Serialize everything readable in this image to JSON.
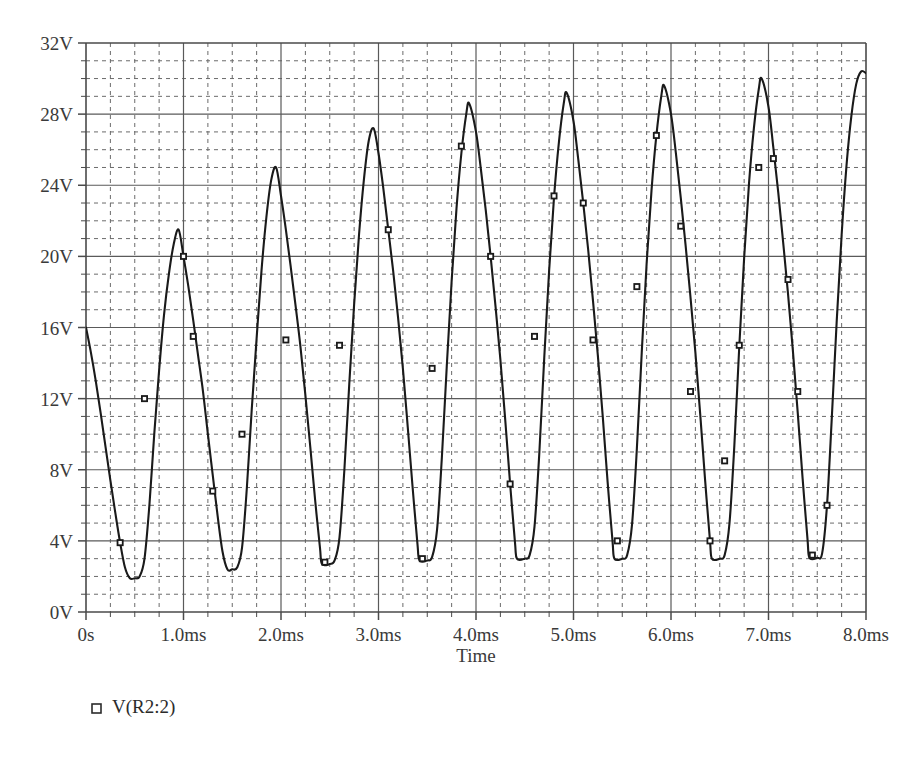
{
  "chart_data": {
    "type": "line",
    "title": "",
    "subtitle": "",
    "xlabel": "Time",
    "ylabel": "",
    "xlim": [
      0,
      8
    ],
    "ylim": [
      0,
      32
    ],
    "x_unit": "ms",
    "y_unit": "V",
    "grid": true,
    "grid_major_x_step": 1,
    "grid_major_y_step": 4,
    "grid_minor_x_step": 0.25,
    "grid_minor_y_step": 1,
    "legend_position": "below-left",
    "xticks": [
      0,
      1,
      2,
      3,
      4,
      5,
      6,
      7,
      8
    ],
    "xticklabels": [
      "0s",
      "1.0ms",
      "2.0ms",
      "3.0ms",
      "4.0ms",
      "5.0ms",
      "6.0ms",
      "7.0ms",
      "8.0ms"
    ],
    "yticks": [
      0,
      4,
      8,
      12,
      16,
      20,
      24,
      28,
      32
    ],
    "yticklabels": [
      "0V",
      "4V",
      "8V",
      "12V",
      "16V",
      "20V",
      "24V",
      "28V",
      "32V"
    ],
    "series": [
      {
        "name": "V(R2:2)",
        "color": "#1a1a1a",
        "marker": "square",
        "peaks": [
          {
            "t": 0.95,
            "v": 21.5
          },
          {
            "t": 1.95,
            "v": 25.0
          },
          {
            "t": 2.95,
            "v": 27.2
          },
          {
            "t": 3.93,
            "v": 28.6
          },
          {
            "t": 4.93,
            "v": 29.2
          },
          {
            "t": 5.93,
            "v": 29.6
          },
          {
            "t": 6.93,
            "v": 30.0
          },
          {
            "t": 7.95,
            "v": 30.4
          }
        ],
        "troughs": [
          {
            "t": 0.45,
            "v": 1.9
          },
          {
            "t": 1.45,
            "v": 2.4
          },
          {
            "t": 2.42,
            "v": 2.7
          },
          {
            "t": 3.42,
            "v": 2.9
          },
          {
            "t": 4.42,
            "v": 3.0
          },
          {
            "t": 5.42,
            "v": 3.0
          },
          {
            "t": 6.42,
            "v": 3.0
          },
          {
            "t": 7.42,
            "v": 3.05
          }
        ],
        "points": [
          {
            "t": 0.0,
            "v": 16.0
          },
          {
            "t": 0.05,
            "v": 14.6
          },
          {
            "t": 0.1,
            "v": 13.0
          },
          {
            "t": 0.15,
            "v": 11.2
          },
          {
            "t": 0.2,
            "v": 9.3
          },
          {
            "t": 0.25,
            "v": 7.4
          },
          {
            "t": 0.3,
            "v": 5.6
          },
          {
            "t": 0.35,
            "v": 3.9
          },
          {
            "t": 0.4,
            "v": 2.5
          },
          {
            "t": 0.45,
            "v": 1.9
          },
          {
            "t": 0.5,
            "v": 1.9
          },
          {
            "t": 0.55,
            "v": 2.0
          },
          {
            "t": 0.6,
            "v": 3.0
          },
          {
            "t": 0.65,
            "v": 6.0
          },
          {
            "t": 0.7,
            "v": 10.0
          },
          {
            "t": 0.75,
            "v": 13.6
          },
          {
            "t": 0.8,
            "v": 16.7
          },
          {
            "t": 0.85,
            "v": 19.0
          },
          {
            "t": 0.9,
            "v": 20.7
          },
          {
            "t": 0.95,
            "v": 21.5
          },
          {
            "t": 1.0,
            "v": 20.0
          },
          {
            "t": 1.05,
            "v": 18.3
          },
          {
            "t": 1.1,
            "v": 16.4
          },
          {
            "t": 1.15,
            "v": 14.4
          },
          {
            "t": 1.2,
            "v": 12.4
          },
          {
            "t": 1.25,
            "v": 10.0
          },
          {
            "t": 1.3,
            "v": 7.7
          },
          {
            "t": 1.35,
            "v": 5.4
          },
          {
            "t": 1.4,
            "v": 3.4
          },
          {
            "t": 1.45,
            "v": 2.4
          },
          {
            "t": 1.5,
            "v": 2.4
          },
          {
            "t": 1.55,
            "v": 2.5
          },
          {
            "t": 1.6,
            "v": 3.6
          },
          {
            "t": 1.65,
            "v": 7.0
          },
          {
            "t": 1.7,
            "v": 11.4
          },
          {
            "t": 1.75,
            "v": 15.4
          },
          {
            "t": 1.8,
            "v": 19.2
          },
          {
            "t": 1.85,
            "v": 22.2
          },
          {
            "t": 1.9,
            "v": 24.3
          },
          {
            "t": 1.95,
            "v": 25.0
          },
          {
            "t": 2.0,
            "v": 23.4
          },
          {
            "t": 2.05,
            "v": 21.5
          },
          {
            "t": 2.1,
            "v": 19.4
          },
          {
            "t": 2.15,
            "v": 17.2
          },
          {
            "t": 2.2,
            "v": 14.9
          },
          {
            "t": 2.25,
            "v": 12.2
          },
          {
            "t": 2.3,
            "v": 9.3
          },
          {
            "t": 2.35,
            "v": 6.3
          },
          {
            "t": 2.4,
            "v": 3.6
          },
          {
            "t": 2.42,
            "v": 2.7
          },
          {
            "t": 2.5,
            "v": 2.7
          },
          {
            "t": 2.55,
            "v": 2.9
          },
          {
            "t": 2.6,
            "v": 4.2
          },
          {
            "t": 2.65,
            "v": 8.0
          },
          {
            "t": 2.7,
            "v": 12.8
          },
          {
            "t": 2.75,
            "v": 17.3
          },
          {
            "t": 2.8,
            "v": 21.2
          },
          {
            "t": 2.85,
            "v": 24.3
          },
          {
            "t": 2.9,
            "v": 26.5
          },
          {
            "t": 2.95,
            "v": 27.2
          },
          {
            "t": 3.0,
            "v": 25.8
          },
          {
            "t": 3.05,
            "v": 23.8
          },
          {
            "t": 3.1,
            "v": 21.5
          },
          {
            "t": 3.15,
            "v": 19.2
          },
          {
            "t": 3.2,
            "v": 16.6
          },
          {
            "t": 3.25,
            "v": 13.7
          },
          {
            "t": 3.3,
            "v": 10.4
          },
          {
            "t": 3.35,
            "v": 7.0
          },
          {
            "t": 3.4,
            "v": 3.8
          },
          {
            "t": 3.42,
            "v": 2.9
          },
          {
            "t": 3.5,
            "v": 2.9
          },
          {
            "t": 3.55,
            "v": 3.1
          },
          {
            "t": 3.6,
            "v": 4.6
          },
          {
            "t": 3.65,
            "v": 8.7
          },
          {
            "t": 3.7,
            "v": 13.8
          },
          {
            "t": 3.75,
            "v": 18.6
          },
          {
            "t": 3.8,
            "v": 22.7
          },
          {
            "t": 3.85,
            "v": 25.8
          },
          {
            "t": 3.9,
            "v": 28.0
          },
          {
            "t": 3.93,
            "v": 28.6
          },
          {
            "t": 4.0,
            "v": 27.0
          },
          {
            "t": 4.05,
            "v": 24.9
          },
          {
            "t": 4.1,
            "v": 22.6
          },
          {
            "t": 4.15,
            "v": 20.0
          },
          {
            "t": 4.2,
            "v": 17.2
          },
          {
            "t": 4.25,
            "v": 14.2
          },
          {
            "t": 4.3,
            "v": 10.8
          },
          {
            "t": 4.35,
            "v": 7.2
          },
          {
            "t": 4.4,
            "v": 3.9
          },
          {
            "t": 4.42,
            "v": 3.0
          },
          {
            "t": 4.5,
            "v": 3.0
          },
          {
            "t": 4.55,
            "v": 3.2
          },
          {
            "t": 4.6,
            "v": 4.8
          },
          {
            "t": 4.65,
            "v": 9.0
          },
          {
            "t": 4.7,
            "v": 14.3
          },
          {
            "t": 4.75,
            "v": 19.2
          },
          {
            "t": 4.8,
            "v": 23.3
          },
          {
            "t": 4.85,
            "v": 26.4
          },
          {
            "t": 4.9,
            "v": 28.6
          },
          {
            "t": 4.93,
            "v": 29.2
          },
          {
            "t": 5.0,
            "v": 27.6
          },
          {
            "t": 5.05,
            "v": 25.4
          },
          {
            "t": 5.1,
            "v": 23.0
          },
          {
            "t": 5.15,
            "v": 20.4
          },
          {
            "t": 5.2,
            "v": 17.5
          },
          {
            "t": 5.25,
            "v": 14.4
          },
          {
            "t": 5.3,
            "v": 11.0
          },
          {
            "t": 5.35,
            "v": 7.3
          },
          {
            "t": 5.4,
            "v": 4.0
          },
          {
            "t": 5.42,
            "v": 3.0
          },
          {
            "t": 5.5,
            "v": 3.0
          },
          {
            "t": 5.55,
            "v": 3.2
          },
          {
            "t": 5.6,
            "v": 4.9
          },
          {
            "t": 5.65,
            "v": 9.2
          },
          {
            "t": 5.7,
            "v": 14.6
          },
          {
            "t": 5.75,
            "v": 19.6
          },
          {
            "t": 5.8,
            "v": 23.7
          },
          {
            "t": 5.85,
            "v": 26.8
          },
          {
            "t": 5.9,
            "v": 29.0
          },
          {
            "t": 5.93,
            "v": 29.6
          },
          {
            "t": 6.0,
            "v": 28.0
          },
          {
            "t": 6.05,
            "v": 25.8
          },
          {
            "t": 6.1,
            "v": 23.3
          },
          {
            "t": 6.15,
            "v": 20.6
          },
          {
            "t": 6.2,
            "v": 17.7
          },
          {
            "t": 6.25,
            "v": 14.6
          },
          {
            "t": 6.3,
            "v": 11.1
          },
          {
            "t": 6.35,
            "v": 7.4
          },
          {
            "t": 6.4,
            "v": 4.0
          },
          {
            "t": 6.42,
            "v": 3.0
          },
          {
            "t": 6.5,
            "v": 3.0
          },
          {
            "t": 6.55,
            "v": 3.2
          },
          {
            "t": 6.6,
            "v": 5.0
          },
          {
            "t": 6.65,
            "v": 9.4
          },
          {
            "t": 6.7,
            "v": 14.9
          },
          {
            "t": 6.75,
            "v": 19.9
          },
          {
            "t": 6.8,
            "v": 24.1
          },
          {
            "t": 6.85,
            "v": 27.2
          },
          {
            "t": 6.9,
            "v": 29.4
          },
          {
            "t": 6.93,
            "v": 30.0
          },
          {
            "t": 7.0,
            "v": 28.4
          },
          {
            "t": 7.05,
            "v": 26.1
          },
          {
            "t": 7.1,
            "v": 23.6
          },
          {
            "t": 7.15,
            "v": 20.8
          },
          {
            "t": 7.2,
            "v": 17.9
          },
          {
            "t": 7.25,
            "v": 14.7
          },
          {
            "t": 7.3,
            "v": 11.2
          },
          {
            "t": 7.35,
            "v": 7.5
          },
          {
            "t": 7.4,
            "v": 4.1
          },
          {
            "t": 7.42,
            "v": 3.05
          },
          {
            "t": 7.5,
            "v": 3.05
          },
          {
            "t": 7.55,
            "v": 3.3
          },
          {
            "t": 7.6,
            "v": 6.0
          },
          {
            "t": 7.65,
            "v": 11.0
          },
          {
            "t": 7.7,
            "v": 16.4
          },
          {
            "t": 7.75,
            "v": 21.2
          },
          {
            "t": 7.8,
            "v": 25.1
          },
          {
            "t": 7.85,
            "v": 27.9
          },
          {
            "t": 7.9,
            "v": 29.7
          },
          {
            "t": 7.95,
            "v": 30.4
          },
          {
            "t": 8.0,
            "v": 30.3
          }
        ],
        "marker_points": [
          {
            "t": 0.35,
            "v": 3.9
          },
          {
            "t": 0.6,
            "v": 12.0
          },
          {
            "t": 1.0,
            "v": 20.0
          },
          {
            "t": 1.1,
            "v": 15.5
          },
          {
            "t": 1.3,
            "v": 6.8
          },
          {
            "t": 1.6,
            "v": 10.0
          },
          {
            "t": 2.05,
            "v": 15.3
          },
          {
            "t": 2.45,
            "v": 2.8
          },
          {
            "t": 2.6,
            "v": 15.0
          },
          {
            "t": 3.1,
            "v": 21.5
          },
          {
            "t": 3.45,
            "v": 3.0
          },
          {
            "t": 3.55,
            "v": 13.7
          },
          {
            "t": 3.85,
            "v": 26.2
          },
          {
            "t": 4.15,
            "v": 20.0
          },
          {
            "t": 4.35,
            "v": 7.2
          },
          {
            "t": 4.6,
            "v": 15.5
          },
          {
            "t": 4.8,
            "v": 23.4
          },
          {
            "t": 5.1,
            "v": 23.0
          },
          {
            "t": 5.2,
            "v": 15.3
          },
          {
            "t": 5.45,
            "v": 4.0
          },
          {
            "t": 5.65,
            "v": 18.3
          },
          {
            "t": 5.85,
            "v": 26.8
          },
          {
            "t": 6.1,
            "v": 21.7
          },
          {
            "t": 6.2,
            "v": 12.4
          },
          {
            "t": 6.4,
            "v": 4.0
          },
          {
            "t": 6.55,
            "v": 8.5
          },
          {
            "t": 6.7,
            "v": 15.0
          },
          {
            "t": 6.9,
            "v": 25.0
          },
          {
            "t": 7.05,
            "v": 25.5
          },
          {
            "t": 7.2,
            "v": 18.7
          },
          {
            "t": 7.3,
            "v": 12.4
          },
          {
            "t": 7.45,
            "v": 3.2
          },
          {
            "t": 7.6,
            "v": 6.0
          }
        ]
      }
    ]
  },
  "legend": {
    "entries": [
      {
        "label": "V(R2:2)",
        "marker": "square-outline",
        "color": "#2b2b2b"
      }
    ]
  },
  "axes": {
    "x_title": "Time",
    "y_title": ""
  },
  "style": {
    "background": "#ffffff",
    "axis_color": "#4a4a4a",
    "major_grid_color": "#5a5a5a",
    "minor_grid_color": "#6b6b6b",
    "trace_color": "#1a1a1a",
    "tick_label_color": "#3a3a3a"
  }
}
